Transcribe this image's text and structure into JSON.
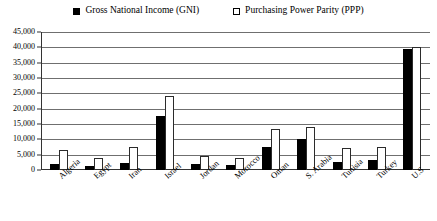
{
  "legend": {
    "entries": [
      {
        "label": "Gross National Income (GNI)",
        "marker": "filled-square-icon",
        "color": "#000000"
      },
      {
        "label": "Purchasing Power Parity (PPP)",
        "marker": "hollow-square-icon",
        "color": "#ffffff"
      }
    ]
  },
  "chart_data": {
    "type": "bar",
    "title": "",
    "subtitle": "",
    "xlabel": "",
    "ylabel": "",
    "ylim": [
      0,
      45000
    ],
    "ytick_labels": [
      "45,000",
      "40,000",
      "35,000",
      "30,000",
      "25,000",
      "20,000",
      "15,000",
      "10,000",
      "5,000",
      "0"
    ],
    "ytick_values": [
      45000,
      40000,
      35000,
      30000,
      25000,
      20000,
      15000,
      10000,
      5000,
      0
    ],
    "grid": true,
    "legend_position": "top",
    "categories": [
      "Algeria",
      "Egypt",
      "Iran",
      "Israel",
      "Jordan",
      "Morocco",
      "Oman",
      "S. Arabia",
      "Tunisia",
      "Turkey",
      "U.S"
    ],
    "series": [
      {
        "name": "Gross National Income (GNI)",
        "color": "#000000",
        "values": [
          2000,
          1200,
          2300,
          17500,
          2000,
          1500,
          7500,
          10000,
          2600,
          3400,
          39500
        ]
      },
      {
        "name": "Purchasing Power Parity (PPP)",
        "color": "#ffffff",
        "values": [
          6500,
          4000,
          7500,
          24000,
          4500,
          4000,
          13500,
          14000,
          7200,
          7500,
          40000
        ]
      }
    ]
  }
}
